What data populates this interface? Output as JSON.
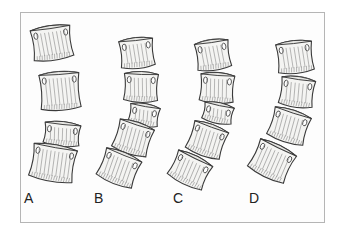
{
  "figure": {
    "panels": [
      {
        "label": "A",
        "label_x": 24,
        "label_y": 191,
        "vertebrae": [
          {
            "cx": 52,
            "cy": 43,
            "w": 40,
            "h": 34,
            "rot": -8
          },
          {
            "cx": 60,
            "cy": 91,
            "w": 40,
            "h": 38,
            "rot": -4
          },
          {
            "cx": 62,
            "cy": 134,
            "w": 36,
            "h": 24,
            "rot": 6
          },
          {
            "cx": 53,
            "cy": 163,
            "w": 44,
            "h": 36,
            "rot": 10
          }
        ]
      },
      {
        "label": "B",
        "label_x": 94,
        "label_y": 191,
        "vertebrae": [
          {
            "cx": 137,
            "cy": 53,
            "w": 34,
            "h": 30,
            "rot": -6
          },
          {
            "cx": 141,
            "cy": 87,
            "w": 34,
            "h": 30,
            "rot": 2
          },
          {
            "cx": 144,
            "cy": 115,
            "w": 30,
            "h": 22,
            "rot": 10
          },
          {
            "cx": 133,
            "cy": 138,
            "w": 36,
            "h": 32,
            "rot": 18
          },
          {
            "cx": 119,
            "cy": 168,
            "w": 38,
            "h": 32,
            "rot": 22
          }
        ]
      },
      {
        "label": "C",
        "label_x": 173,
        "label_y": 191,
        "vertebrae": [
          {
            "cx": 213,
            "cy": 55,
            "w": 34,
            "h": 30,
            "rot": -8
          },
          {
            "cx": 217,
            "cy": 88,
            "w": 34,
            "h": 30,
            "rot": 4
          },
          {
            "cx": 218,
            "cy": 113,
            "w": 30,
            "h": 20,
            "rot": 12
          },
          {
            "cx": 207,
            "cy": 140,
            "w": 36,
            "h": 32,
            "rot": 20
          },
          {
            "cx": 190,
            "cy": 170,
            "w": 38,
            "h": 30,
            "rot": 26
          }
        ]
      },
      {
        "label": "D",
        "label_x": 249,
        "label_y": 191,
        "vertebrae": [
          {
            "cx": 295,
            "cy": 57,
            "w": 36,
            "h": 32,
            "rot": -6
          },
          {
            "cx": 297,
            "cy": 92,
            "w": 34,
            "h": 30,
            "rot": 8
          },
          {
            "cx": 289,
            "cy": 126,
            "w": 38,
            "h": 32,
            "rot": 18
          },
          {
            "cx": 272,
            "cy": 161,
            "w": 40,
            "h": 34,
            "rot": 26
          }
        ]
      }
    ],
    "colors": {
      "border": "#b5b5b5",
      "stroke": "#3a3a3a",
      "fill": "#f4f4f2",
      "label": "#222222"
    }
  }
}
